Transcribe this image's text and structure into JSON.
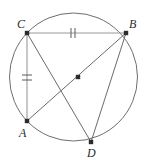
{
  "figure": {
    "type": "geometry-diagram",
    "width": 149,
    "height": 160,
    "background_color": "#ffffff"
  },
  "circle": {
    "name": "circumscribed-circle",
    "center_x": 73.5,
    "center_y": 77,
    "radius": 64,
    "stroke_color": "#6e6e6e",
    "stroke_width": 1
  },
  "center_point": {
    "label": "",
    "x": 78,
    "y": 77,
    "color": "#2b2b2b"
  },
  "points": [
    {
      "label": "C",
      "x": 27,
      "y": 33,
      "label_x": 17,
      "label_y": 28,
      "color": "#2b2b2b"
    },
    {
      "label": "B",
      "x": 126,
      "y": 33,
      "label_x": 129,
      "label_y": 28,
      "color": "#2b2b2b"
    },
    {
      "label": "A",
      "x": 27,
      "y": 121,
      "label_x": 19,
      "label_y": 137,
      "color": "#2b2b2b"
    },
    {
      "label": "D",
      "x": 91,
      "y": 142,
      "label_x": 87,
      "label_y": 157,
      "color": "#2b2b2b"
    }
  ],
  "segments": [
    {
      "name": "segment-CB",
      "from": "C",
      "to": "B",
      "x1": 27,
      "y1": 33,
      "x2": 126,
      "y2": 33,
      "ticks": 2,
      "color": "#9a9a9a"
    },
    {
      "name": "segment-CA",
      "from": "C",
      "to": "A",
      "x1": 27,
      "y1": 33,
      "x2": 27,
      "y2": 121,
      "ticks": 2,
      "color": "#9a9a9a"
    },
    {
      "name": "segment-CD",
      "from": "C",
      "to": "D",
      "x1": 27,
      "y1": 33,
      "x2": 91,
      "y2": 142,
      "ticks": 0,
      "color": "#6b6b6b"
    },
    {
      "name": "segment-AB",
      "from": "A",
      "to": "B",
      "x1": 27,
      "y1": 121,
      "x2": 126,
      "y2": 33,
      "ticks": 0,
      "color": "#6b6b6b"
    },
    {
      "name": "segment-BD",
      "from": "B",
      "to": "D",
      "x1": 126,
      "y1": 33,
      "x2": 91,
      "y2": 142,
      "ticks": 0,
      "color": "#6b6b6b"
    }
  ],
  "tick_marks": [
    {
      "name": "tick-CB-1",
      "x1": 71,
      "y1": 28,
      "x2": 71,
      "y2": 38,
      "on_segment": "segment-CB"
    },
    {
      "name": "tick-CB-2",
      "x1": 75,
      "y1": 28,
      "x2": 75,
      "y2": 38,
      "on_segment": "segment-CB"
    },
    {
      "name": "tick-CA-1",
      "x1": 22,
      "y1": 75,
      "x2": 32,
      "y2": 75,
      "on_segment": "segment-CA"
    },
    {
      "name": "tick-CA-2",
      "x1": 22,
      "y1": 80,
      "x2": 32,
      "y2": 80,
      "on_segment": "segment-CA"
    }
  ]
}
